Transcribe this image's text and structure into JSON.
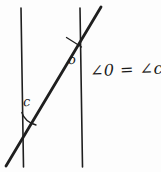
{
  "figure": {
    "background_color": "#fdfdfd",
    "stroke_color": "#1f1f1f",
    "labels": {
      "angle_o": "o",
      "angle_c": "c",
      "equation": "∠0 = ∠c"
    },
    "geometry": {
      "left_parallel_line": {
        "x1": 21,
        "y1": 8,
        "x2": 23,
        "y2": 167
      },
      "right_parallel_line": {
        "x1": 80,
        "y1": 8,
        "x2": 82,
        "y2": 167
      },
      "transversal": {
        "x1": 6,
        "y1": 166,
        "x2": 101,
        "y2": 7
      },
      "arc_o": {
        "cx": 73,
        "cy": 33,
        "r": 15
      },
      "arc_c": {
        "cx": 22,
        "cy": 104,
        "r": 16
      }
    }
  }
}
